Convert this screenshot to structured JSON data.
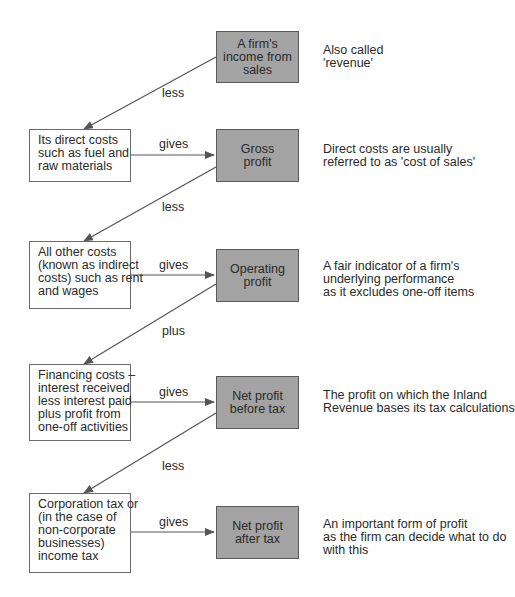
{
  "diagram": {
    "type": "flow",
    "nodes": [
      {
        "id": "income",
        "lines": [
          "A firm's",
          "income from",
          "sales"
        ],
        "style": "grey",
        "note": [
          "Also called",
          "'revenue'"
        ]
      },
      {
        "id": "direct_costs",
        "lines": [
          "Its direct costs",
          "such as fuel and",
          "raw materials"
        ],
        "style": "white"
      },
      {
        "id": "gross_profit",
        "lines": [
          "Gross",
          "profit"
        ],
        "style": "grey",
        "note": [
          "Direct costs are usually",
          "referred to as 'cost of sales'"
        ]
      },
      {
        "id": "other_costs",
        "lines": [
          "All other costs",
          "(known as indirect",
          "costs) such as rent",
          "and wages"
        ],
        "style": "white"
      },
      {
        "id": "operating_profit",
        "lines": [
          "Operating",
          "profit"
        ],
        "style": "grey",
        "note": [
          "A fair indicator of a firm's",
          "underlying performance",
          "as it excludes one-off items"
        ]
      },
      {
        "id": "financing",
        "lines": [
          "Financing costs –",
          "interest received",
          "less interest paid",
          "plus profit from",
          "one-off activities"
        ],
        "style": "white"
      },
      {
        "id": "npbt",
        "lines": [
          "Net profit",
          "before tax"
        ],
        "style": "grey",
        "note": [
          "The profit on which the Inland",
          "Revenue bases its tax calculations"
        ]
      },
      {
        "id": "tax",
        "lines": [
          "Corporation tax or",
          "(in the case of",
          "non-corporate",
          "businesses)",
          "income tax"
        ],
        "style": "white"
      },
      {
        "id": "npat",
        "lines": [
          "Net profit",
          "after tax"
        ],
        "style": "grey",
        "note": [
          "An important form of profit",
          "as the firm can decide what to do",
          "with this"
        ]
      }
    ],
    "edges": [
      {
        "from": "income",
        "to": "direct_costs",
        "label": "less"
      },
      {
        "from": "direct_costs",
        "to": "gross_profit",
        "label": "gives"
      },
      {
        "from": "gross_profit",
        "to": "other_costs",
        "label": "less"
      },
      {
        "from": "other_costs",
        "to": "operating_profit",
        "label": "gives"
      },
      {
        "from": "operating_profit",
        "to": "financing",
        "label": "plus"
      },
      {
        "from": "financing",
        "to": "npbt",
        "label": "gives"
      },
      {
        "from": "npbt",
        "to": "tax",
        "label": "less"
      },
      {
        "from": "tax",
        "to": "npat",
        "label": "gives"
      }
    ],
    "colors": {
      "grey_box": "#a3a3a3",
      "border": "#5a5a5a",
      "line": "#555555",
      "text": "#2a2a2a"
    }
  }
}
